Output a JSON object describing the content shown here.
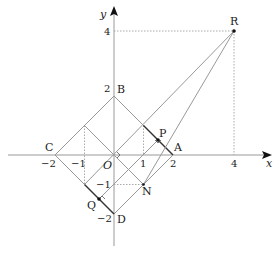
{
  "diagram": {
    "axes": {
      "x_label": "x",
      "y_label": "y"
    },
    "x_ticks": [
      {
        "v": -2,
        "t": "−2"
      },
      {
        "v": -1,
        "t": "−1"
      },
      {
        "v": 1,
        "t": "1"
      },
      {
        "v": 2,
        "t": "2"
      },
      {
        "v": 4,
        "t": "4"
      }
    ],
    "y_ticks": [
      {
        "v": 4,
        "t": "4"
      },
      {
        "v": 2,
        "t": "2"
      },
      {
        "v": -1,
        "t": "−1"
      },
      {
        "v": -2,
        "t": "−2"
      }
    ],
    "points": {
      "A": {
        "label": "A",
        "x": 2,
        "y": 0
      },
      "B": {
        "label": "B",
        "x": 0,
        "y": 2
      },
      "C": {
        "label": "C",
        "x": -2,
        "y": 0
      },
      "D": {
        "label": "D",
        "x": 0,
        "y": -2
      },
      "O": {
        "label": "O",
        "x": 0,
        "y": 0
      },
      "P": {
        "label": "P",
        "x": 1.5,
        "y": 0.5
      },
      "Q": {
        "label": "Q",
        "x": -0.5,
        "y": -1.5
      },
      "N": {
        "label": "N",
        "x": 1,
        "y": -1
      },
      "R": {
        "label": "R",
        "x": 4,
        "y": 4
      }
    },
    "colors": {
      "line": "#9a9a9a",
      "dark": "#333333",
      "dotted": "#aaaaaa"
    }
  }
}
